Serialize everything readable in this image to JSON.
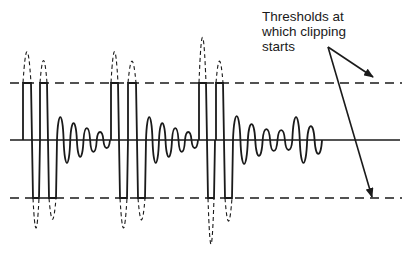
{
  "annotation": {
    "lines": [
      "Thresholds at",
      "which clipping",
      "starts"
    ]
  },
  "colors": {
    "stroke": "#1a1a1a",
    "background": "#ffffff"
  },
  "geometry": {
    "baseline_y": 140,
    "upper_threshold_y": 83,
    "lower_threshold_y": 198,
    "x_start": 10,
    "x_end": 402
  },
  "clipped_groups": [
    {
      "pulses": [
        {
          "up": [
            23,
            31
          ],
          "down": [
            33,
            39
          ],
          "peak_top": 33,
          "peak_bottom": 246
        },
        {
          "up": [
            40,
            47
          ],
          "down": [
            49,
            56
          ],
          "peak_top": 47,
          "peak_bottom": 232
        }
      ]
    },
    {
      "pulses": [
        {
          "up": [
            111,
            118
          ],
          "down": [
            120,
            127
          ],
          "peak_top": 33,
          "peak_bottom": 246
        },
        {
          "up": [
            128,
            136
          ],
          "down": [
            138,
            145
          ],
          "peak_top": 48,
          "peak_bottom": 233
        }
      ]
    },
    {
      "pulses": [
        {
          "up": [
            199,
            206
          ],
          "down": [
            208,
            214
          ],
          "peak_top": 10,
          "peak_bottom": 272
        },
        {
          "up": [
            216,
            223
          ],
          "down": [
            225,
            232
          ],
          "peak_top": 48,
          "peak_bottom": 235
        }
      ]
    }
  ],
  "ringing": [
    {
      "x0": 57,
      "x1": 110,
      "amps": [
        23,
        17,
        12,
        8
      ]
    },
    {
      "x0": 146,
      "x1": 198,
      "amps": [
        23,
        17,
        12,
        8
      ]
    },
    {
      "x0": 233,
      "x1": 322,
      "amps": [
        24,
        16,
        11,
        10,
        23,
        14
      ]
    }
  ],
  "arrows": [
    {
      "from": [
        328,
        47
      ],
      "to": [
        373,
        77
      ]
    },
    {
      "from": [
        328,
        47
      ],
      "to": [
        372,
        197
      ]
    }
  ]
}
